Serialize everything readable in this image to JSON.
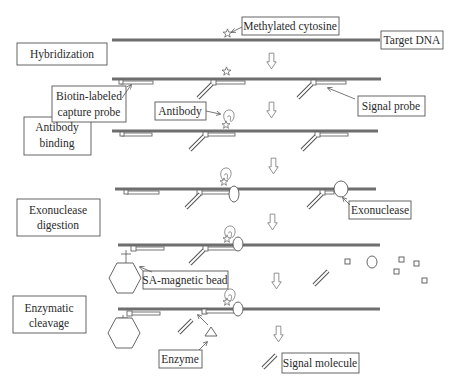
{
  "diagram": {
    "steps": [
      {
        "label_lines": [
          "Hybridization"
        ]
      },
      {
        "label_lines": [
          "Antibody",
          "binding"
        ]
      },
      {
        "label_lines": [
          "Exonuclease",
          "digestion"
        ]
      },
      {
        "label_lines": [
          "Enzymatic",
          "cleavage"
        ]
      }
    ],
    "callouts": {
      "methylated_cytosine": "Methylated cytosine",
      "target_dna": "Target DNA",
      "capture_probe": [
        "Biotin-labeled",
        "capture probe"
      ],
      "antibody": "Antibody",
      "signal_probe": "Signal probe",
      "exonuclease": "Exonuclease",
      "sa_magnetic_bead": "SA-magnetic bead",
      "enzyme": "Enzyme",
      "signal_molecule": "Signal molecule"
    },
    "colors": {
      "dna_strand": "#6e6e6e",
      "outline": "#555555",
      "background": "#ffffff"
    }
  }
}
